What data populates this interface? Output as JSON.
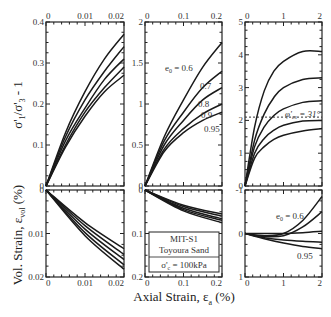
{
  "figure": {
    "ylabel_top": "σ'1/σ'3 - 1",
    "ylabel_bottom": "Vol. Strain, εvol (%)",
    "xlabel": "Axial Strain, εa (%)",
    "legend_box": {
      "line1": "MIT-S1",
      "line2": "Toyoura Sand",
      "line3": "σ'c = 100kPa"
    },
    "annotation_phi": "φ'cs = 31°",
    "e0_labels_mid": [
      "e0 = 0.6",
      "0.7",
      "0.8",
      "0.9",
      "0.95"
    ],
    "e0_labels_right_bottom": [
      "e0 = 0.6",
      "0.95"
    ]
  },
  "chart_data": [
    {
      "type": "line",
      "panel": "top-left",
      "xlim": [
        0,
        0.02
      ],
      "ylim": [
        0,
        0.4
      ],
      "xticks": [
        "0",
        "0.01",
        "0.02"
      ],
      "yticks": [
        "0",
        "0.1",
        "0.2",
        "0.3",
        "0.4"
      ],
      "xlabel": "Axial Strain, εa (%)",
      "ylabel": "σ'1/σ'3 - 1",
      "series": [
        {
          "name": "e0 = 0.6",
          "x": [
            0,
            0.005,
            0.01,
            0.015,
            0.02
          ],
          "y": [
            0,
            0.13,
            0.23,
            0.31,
            0.37
          ]
        },
        {
          "name": "e0 = 0.7",
          "x": [
            0,
            0.005,
            0.01,
            0.015,
            0.02
          ],
          "y": [
            0,
            0.12,
            0.21,
            0.28,
            0.34
          ]
        },
        {
          "name": "e0 = 0.8",
          "x": [
            0,
            0.005,
            0.01,
            0.015,
            0.02
          ],
          "y": [
            0,
            0.11,
            0.19,
            0.26,
            0.31
          ]
        },
        {
          "name": "e0 = 0.9",
          "x": [
            0,
            0.005,
            0.01,
            0.015,
            0.02
          ],
          "y": [
            0,
            0.1,
            0.18,
            0.24,
            0.29
          ]
        },
        {
          "name": "e0 = 0.95",
          "x": [
            0,
            0.005,
            0.01,
            0.015,
            0.02
          ],
          "y": [
            0,
            0.095,
            0.17,
            0.23,
            0.27
          ]
        }
      ]
    },
    {
      "type": "line",
      "panel": "top-middle",
      "xlim": [
        0,
        0.2
      ],
      "ylim": [
        0,
        2
      ],
      "xticks": [
        "0",
        "0.1",
        "0.2"
      ],
      "yticks": [
        "0",
        "0.5",
        "1",
        "1.5",
        "2"
      ],
      "series": [
        {
          "name": "e0 = 0.6",
          "x": [
            0,
            0.05,
            0.1,
            0.15,
            0.2
          ],
          "y": [
            0,
            0.6,
            1.05,
            1.45,
            1.75
          ]
        },
        {
          "name": "e0 = 0.7",
          "x": [
            0,
            0.05,
            0.1,
            0.15,
            0.2
          ],
          "y": [
            0,
            0.55,
            0.9,
            1.2,
            1.4
          ]
        },
        {
          "name": "e0 = 0.8",
          "x": [
            0,
            0.05,
            0.1,
            0.15,
            0.2
          ],
          "y": [
            0,
            0.5,
            0.8,
            1.05,
            1.2
          ]
        },
        {
          "name": "e0 = 0.9",
          "x": [
            0,
            0.05,
            0.1,
            0.15,
            0.2
          ],
          "y": [
            0,
            0.45,
            0.7,
            0.88,
            1.0
          ]
        },
        {
          "name": "e0 = 0.95",
          "x": [
            0,
            0.05,
            0.1,
            0.15,
            0.2
          ],
          "y": [
            0,
            0.42,
            0.65,
            0.8,
            0.9
          ]
        }
      ]
    },
    {
      "type": "line",
      "panel": "top-right",
      "xlim": [
        0,
        2
      ],
      "ylim": [
        0,
        5
      ],
      "xticks": [
        "0",
        "1",
        "2"
      ],
      "yticks": [
        "0",
        "1",
        "2",
        "3",
        "4",
        "5"
      ],
      "reference_line": {
        "y": 2.1,
        "label": "φ'cs = 31°",
        "style": "dashed"
      },
      "series": [
        {
          "name": "e0 = 0.6",
          "x": [
            0,
            0.25,
            0.5,
            0.75,
            1.0,
            1.5,
            2.0
          ],
          "y": [
            0,
            1.8,
            2.9,
            3.5,
            3.8,
            4.1,
            4.1
          ]
        },
        {
          "name": "e0 = 0.7",
          "x": [
            0,
            0.25,
            0.5,
            0.75,
            1.0,
            1.5,
            2.0
          ],
          "y": [
            0,
            1.4,
            2.2,
            2.7,
            3.0,
            3.25,
            3.3
          ]
        },
        {
          "name": "e0 = 0.8",
          "x": [
            0,
            0.25,
            0.5,
            0.75,
            1.0,
            1.5,
            2.0
          ],
          "y": [
            0,
            1.2,
            1.8,
            2.15,
            2.35,
            2.55,
            2.6
          ]
        },
        {
          "name": "e0 = 0.9",
          "x": [
            0,
            0.25,
            0.5,
            0.75,
            1.0,
            1.5,
            2.0
          ],
          "y": [
            0,
            1.0,
            1.45,
            1.7,
            1.85,
            1.98,
            2.0
          ]
        },
        {
          "name": "e0 = 0.95",
          "x": [
            0,
            0.25,
            0.5,
            0.75,
            1.0,
            1.5,
            2.0
          ],
          "y": [
            0,
            0.85,
            1.2,
            1.42,
            1.55,
            1.68,
            1.75
          ]
        }
      ]
    },
    {
      "type": "line",
      "panel": "bottom-left",
      "xlim": [
        0,
        0.02
      ],
      "ylim": [
        0,
        0.02
      ],
      "y_inverted": true,
      "xticks": [
        "0",
        "0.01",
        "0.02"
      ],
      "yticks": [
        "0",
        "0.01",
        "0.02"
      ],
      "ylabel": "Vol. Strain, εvol (%)",
      "series": [
        {
          "name": "e0 = 0.6",
          "x": [
            0,
            0.01,
            0.02
          ],
          "y": [
            0,
            0.0075,
            0.0135
          ]
        },
        {
          "name": "e0 = 0.7",
          "x": [
            0,
            0.01,
            0.02
          ],
          "y": [
            0,
            0.0082,
            0.0148
          ]
        },
        {
          "name": "e0 = 0.8",
          "x": [
            0,
            0.01,
            0.02
          ],
          "y": [
            0,
            0.009,
            0.016
          ]
        },
        {
          "name": "e0 = 0.9",
          "x": [
            0,
            0.01,
            0.02
          ],
          "y": [
            0,
            0.0098,
            0.0172
          ]
        },
        {
          "name": "e0 = 0.95",
          "x": [
            0,
            0.01,
            0.02
          ],
          "y": [
            0,
            0.0105,
            0.0182
          ]
        }
      ]
    },
    {
      "type": "line",
      "panel": "bottom-middle",
      "xlim": [
        0,
        0.2
      ],
      "ylim": [
        0,
        0.2
      ],
      "y_inverted": true,
      "xticks": [
        "0",
        "0.1",
        "0.2"
      ],
      "yticks": [
        "0",
        "0.1",
        "0.2"
      ],
      "series": [
        {
          "name": "e0 = 0.6",
          "x": [
            0,
            0.1,
            0.2
          ],
          "y": [
            0,
            0.035,
            0.055
          ]
        },
        {
          "name": "e0 = 0.7",
          "x": [
            0,
            0.1,
            0.2
          ],
          "y": [
            0,
            0.038,
            0.06
          ]
        },
        {
          "name": "e0 = 0.8",
          "x": [
            0,
            0.1,
            0.2
          ],
          "y": [
            0,
            0.042,
            0.066
          ]
        },
        {
          "name": "e0 = 0.9",
          "x": [
            0,
            0.1,
            0.2
          ],
          "y": [
            0,
            0.045,
            0.07
          ]
        },
        {
          "name": "e0 = 0.95",
          "x": [
            0,
            0.1,
            0.2
          ],
          "y": [
            0,
            0.048,
            0.075
          ]
        }
      ]
    },
    {
      "type": "line",
      "panel": "bottom-right",
      "xlim": [
        0,
        2
      ],
      "ylim": [
        -1,
        1
      ],
      "y_inverted": true,
      "xticks": [
        "0",
        "1",
        "2"
      ],
      "yticks": [
        "-1",
        "0",
        "1"
      ],
      "series": [
        {
          "name": "e0 = 0.6",
          "x": [
            0,
            0.5,
            1.0,
            1.5,
            2.0
          ],
          "y": [
            0,
            0.05,
            0.0,
            -0.3,
            -0.85
          ]
        },
        {
          "name": "e0 = 0.7",
          "x": [
            0,
            0.5,
            1.0,
            1.5,
            2.0
          ],
          "y": [
            0,
            0.07,
            0.05,
            -0.15,
            -0.5
          ]
        },
        {
          "name": "e0 = 0.8",
          "x": [
            0,
            0.5,
            1.0,
            1.5,
            2.0
          ],
          "y": [
            0,
            0.0,
            0.0,
            -0.02,
            -0.05
          ]
        },
        {
          "name": "e0 = 0.9",
          "x": [
            0,
            0.5,
            1.0,
            1.5,
            2.0
          ],
          "y": [
            0,
            0.1,
            0.15,
            0.18,
            0.2
          ]
        },
        {
          "name": "e0 = 0.95",
          "x": [
            0,
            0.5,
            1.0,
            1.5,
            2.0
          ],
          "y": [
            0,
            0.12,
            0.22,
            0.3,
            0.35
          ]
        }
      ]
    }
  ]
}
